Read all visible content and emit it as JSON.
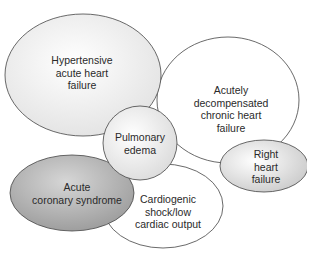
{
  "diagram": {
    "type": "overlapping-ellipses",
    "nodes": [
      {
        "id": "hypertensive",
        "label": "Hypertensive\nacute heart\nfailure",
        "fill": "#f0f0f0"
      },
      {
        "id": "acutely-decompensated",
        "label": "Acutely\ndecompensated\nchronic heart\nfailure",
        "fill": "#ffffff"
      },
      {
        "id": "pulmonary-edema",
        "label": "Pulmonary\nedema",
        "fill": "#ededed"
      },
      {
        "id": "acute-coronary-syndrome",
        "label": "Acute\ncoronary syndrome",
        "fill": "#b8b8b8"
      },
      {
        "id": "cardiogenic-shock",
        "label": "Cardiogenic\nshock/low\ncardiac output",
        "fill": "#ffffff"
      },
      {
        "id": "right-heart-failure",
        "label": "Right heart\nfailure",
        "fill": "#dcdcdc"
      }
    ],
    "stroke_color": "#444444"
  }
}
